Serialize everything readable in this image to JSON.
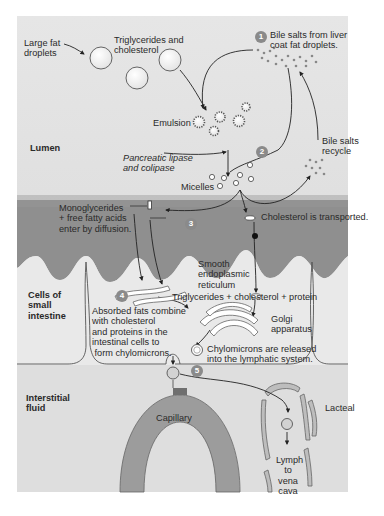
{
  "colors": {
    "background_top": "#e4e4e4",
    "background_bottom": "#d7d7d7",
    "lumen_wall": "#8e8e8e",
    "cell_fill": "#e8e8e8",
    "capillary": "#9a9a9a",
    "step_badge": "#8a8a8a",
    "text": "#2a2a2a"
  },
  "regions": {
    "lumen": "Lumen",
    "cells": "Cells of\nsmall\nintestine",
    "interstitial": "Interstitial\nfluid"
  },
  "labels": {
    "large_fat_droplets": "Large fat\ndroplets",
    "triglycerides_cholesterol": "Triglycerides and\ncholesterol",
    "emulsion": "Emulsion",
    "pancreatic_lipase": "Pancreatic lipase\nand colipase",
    "micelles": "Micelles",
    "bile_salts_recycle": "Bile salts\nrecycle",
    "monoglycerides": "Monoglycerides\n+ free fatty acids\nenter by diffusion.",
    "cholesterol_transported": "Cholesterol is transported.",
    "smooth_er": "Smooth\nendoplasmic\nreticulum",
    "tg_chol_protein": "Triglycerides + cholesterol + protein",
    "golgi": "Golgi\napparatus",
    "chylomicrons_released": "Chylomicrons are released\ninto the lymphatic system.",
    "capillary": "Capillary",
    "lacteal": "Lacteal",
    "lymph": "Lymph\nto\nvena\ncava"
  },
  "steps": [
    {
      "num": "1",
      "text": "Bile salts from liver\ncoat fat droplets."
    },
    {
      "num": "2",
      "text": ""
    },
    {
      "num": "3",
      "text": ""
    },
    {
      "num": "4",
      "text": "Absorbed fats combine\nwith cholesterol\nand proteins in the\nintestinal cells to\n form chylomicrons."
    },
    {
      "num": "5",
      "text": ""
    }
  ]
}
